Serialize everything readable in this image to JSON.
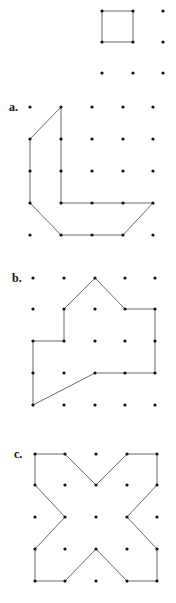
{
  "figures": [
    {
      "id": "example",
      "label": "",
      "grid": {
        "xs": [
          102,
          133,
          163
        ],
        "ys": [
          11,
          42,
          73
        ]
      },
      "polygon": [
        [
          102,
          11
        ],
        [
          133,
          11
        ],
        [
          133,
          42
        ],
        [
          102,
          42
        ]
      ],
      "label_pos": [
        0,
        0
      ]
    },
    {
      "id": "a",
      "label": "a.",
      "grid": {
        "xs": [
          30,
          61,
          92,
          123,
          153
        ],
        "ys": [
          107,
          139,
          171,
          203,
          235
        ]
      },
      "polygon": [
        [
          61,
          107
        ],
        [
          61,
          203
        ],
        [
          153,
          203
        ],
        [
          123,
          235
        ],
        [
          61,
          235
        ],
        [
          30,
          203
        ],
        [
          30,
          139
        ]
      ],
      "label_pos": [
        9,
        111
      ]
    },
    {
      "id": "b",
      "label": "b.",
      "grid": {
        "xs": [
          33,
          64,
          95,
          125,
          155
        ],
        "ys": [
          278,
          309,
          341,
          373,
          405
        ]
      },
      "polygon": [
        [
          95,
          278
        ],
        [
          125,
          309
        ],
        [
          155,
          309
        ],
        [
          155,
          373
        ],
        [
          95,
          373
        ],
        [
          33,
          405
        ],
        [
          33,
          341
        ],
        [
          64,
          341
        ],
        [
          64,
          309
        ]
      ],
      "label_pos": [
        12,
        282
      ]
    },
    {
      "id": "c",
      "label": "c.",
      "grid": {
        "xs": [
          35,
          65,
          96,
          127,
          157
        ],
        "ys": [
          454,
          485,
          517,
          549,
          581
        ]
      },
      "polygon": [
        [
          35,
          454
        ],
        [
          65,
          454
        ],
        [
          96,
          485
        ],
        [
          127,
          454
        ],
        [
          157,
          454
        ],
        [
          157,
          485
        ],
        [
          127,
          517
        ],
        [
          157,
          549
        ],
        [
          157,
          581
        ],
        [
          127,
          581
        ],
        [
          96,
          549
        ],
        [
          65,
          581
        ],
        [
          35,
          581
        ],
        [
          35,
          549
        ],
        [
          65,
          517
        ],
        [
          35,
          485
        ]
      ],
      "label_pos": [
        14,
        458
      ]
    }
  ],
  "colors": {
    "dot": "#111111",
    "edge": "#6a6a6a"
  }
}
